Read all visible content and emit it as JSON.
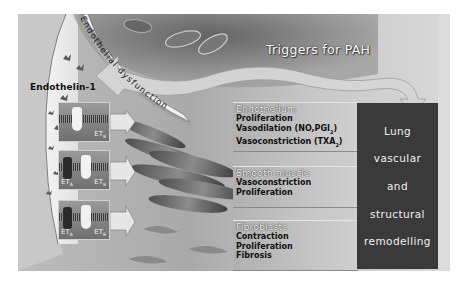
{
  "figure": {
    "curved_label": "Endothelial dysfunction",
    "lumen_label": "Endothelin-1",
    "trigger_label": "Triggers for PAH",
    "receptor_panels": [
      {
        "labels": [
          {
            "text": "ET",
            "sub": "B"
          }
        ]
      },
      {
        "labels": [
          {
            "text": "ET",
            "sub": "A"
          },
          {
            "text": "ET",
            "sub": "B"
          }
        ]
      },
      {
        "labels": [
          {
            "text": "ET",
            "sub": "A"
          },
          {
            "text": "ET",
            "sub": "B"
          }
        ]
      }
    ],
    "effects": [
      {
        "title": "Endothelium",
        "lines": [
          "Proliferation",
          "Vasodilation (NO,PGI",
          "Vasoconstriction (TXA"
        ],
        "subs": [
          "",
          "2",
          "2"
        ],
        "tails": [
          "",
          ")",
          ")"
        ]
      },
      {
        "title": "Smooth muscle",
        "lines": [
          "Vasoconstriction",
          "Proliferation"
        ]
      },
      {
        "title": "Fibroblasts",
        "lines": [
          "Contraction",
          "Proliferation",
          "Fibrosis"
        ]
      }
    ],
    "outcome": {
      "lines": [
        "Lung",
        "vascular",
        "and",
        "structural",
        "remodelling"
      ],
      "color": "#3a3a3a"
    }
  }
}
